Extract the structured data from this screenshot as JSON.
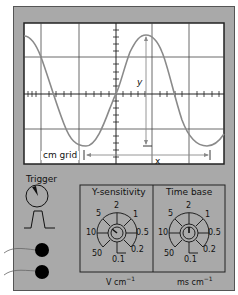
{
  "screen": {
    "grid_label": "cm grid",
    "x_label": "x",
    "y_label": "y",
    "background": "#ffffff",
    "trace_color": "#888888",
    "grid_color": "#333333"
  },
  "trigger": {
    "label": "Trigger"
  },
  "controls": {
    "y_sensitivity": {
      "title": "Y-sensitivity",
      "unit": "V cm",
      "unit_exp": "−1",
      "scale": [
        "2",
        "1",
        "0.5",
        "0.2",
        "0.1",
        "50",
        "10",
        "5"
      ],
      "selected": "10"
    },
    "time_base": {
      "title": "Time base",
      "unit": "ms cm",
      "unit_exp": "−1",
      "scale": [
        "2",
        "1",
        "0.5",
        "0.2",
        "0.1",
        "50",
        "10",
        "5"
      ],
      "selected": "2"
    }
  },
  "inputs": {
    "count": 2
  },
  "colors": {
    "frame": "#a9a9a9",
    "panel_border": "#333333",
    "socket": "#000000"
  }
}
